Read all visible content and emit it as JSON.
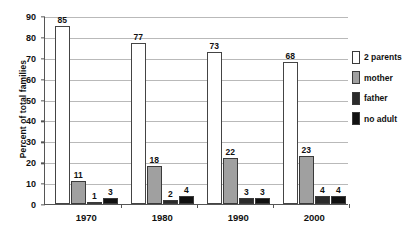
{
  "chart_data": {
    "type": "bar",
    "title": "",
    "xlabel": "",
    "ylabel": "Percent of total families",
    "categories": [
      "1970",
      "1980",
      "1990",
      "2000"
    ],
    "ylim": [
      0,
      90
    ],
    "ytick_step": 10,
    "yticks": [
      "0",
      "10",
      "20",
      "30",
      "40",
      "50",
      "60",
      "70",
      "80",
      "90"
    ],
    "grid": true,
    "legend_position": "right",
    "series": [
      {
        "name": "2 parents",
        "color": "#ffffff",
        "values": [
          85,
          77,
          73,
          68
        ]
      },
      {
        "name": "mother",
        "color": "#a0a0a0",
        "values": [
          11,
          18,
          22,
          23
        ]
      },
      {
        "name": "father",
        "color": "#2b2b2b",
        "values": [
          1,
          2,
          3,
          4
        ]
      },
      {
        "name": "no adult",
        "color": "#111111",
        "values": [
          3,
          4,
          3,
          4
        ]
      }
    ]
  }
}
